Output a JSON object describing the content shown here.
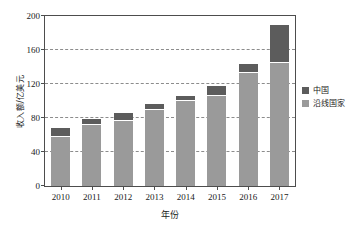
{
  "chart_data": {
    "type": "bar",
    "stacked": true,
    "title": "",
    "subtitle": "",
    "xlabel": "年份",
    "ylabel": "收入额/亿美元",
    "categories": [
      "2010",
      "2011",
      "2012",
      "2013",
      "2014",
      "2015",
      "2016",
      "2017"
    ],
    "series": [
      {
        "name": "沿线国家",
        "color": "#9a9a9a",
        "values": [
          58,
          72,
          76,
          89,
          100,
          106,
          133,
          145
        ]
      },
      {
        "name": "中国",
        "color": "#5c5c5c",
        "values": [
          10,
          7,
          10,
          8,
          6,
          12,
          10,
          45
        ]
      }
    ],
    "totals": [
      68,
      79,
      86,
      97,
      106,
      118,
      143,
      190
    ],
    "ylim": [
      0,
      200
    ],
    "yticks": [
      0,
      40,
      80,
      120,
      160,
      200
    ],
    "ytick_labels": [
      "0",
      "40",
      "80",
      "120",
      "160",
      "200"
    ],
    "gridlines": [
      40,
      80,
      120,
      160
    ],
    "grid": true,
    "legend_position": "right"
  },
  "legend": {
    "items": [
      {
        "label": "中国",
        "color": "#5c5c5c"
      },
      {
        "label": "沿线国家",
        "color": "#9a9a9a"
      }
    ]
  },
  "axes": {
    "y_title": "收入额/亿美元",
    "x_title": "年份"
  }
}
